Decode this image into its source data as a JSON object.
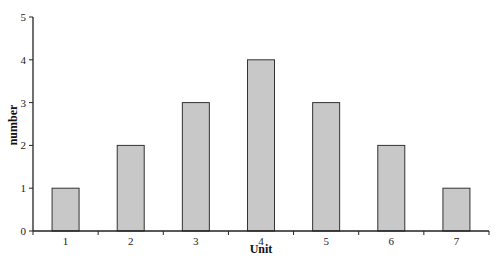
{
  "chart_data": {
    "type": "bar",
    "title": "",
    "xlabel": "Unit",
    "ylabel": "number",
    "categories": [
      "1",
      "2",
      "3",
      "4",
      "5",
      "6",
      "7"
    ],
    "values": [
      1,
      2,
      3,
      4,
      3,
      2,
      1
    ],
    "ylim": [
      0,
      5
    ],
    "yticks": [
      "0",
      "1",
      "2",
      "3",
      "4",
      "5"
    ],
    "grid": false,
    "legend": null,
    "bar_color": "#c8c8c8",
    "bar_edge_color": "#333333"
  }
}
